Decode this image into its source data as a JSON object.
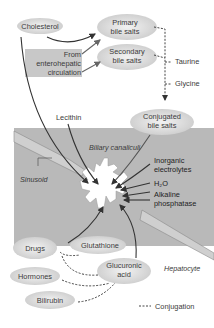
{
  "nodes": {
    "cholesterol": "Cholesterol",
    "primary_bile_salts_1": "Primary",
    "primary_bile_salts_2": "bile salts",
    "secondary_bile_salts_1": "Secondary",
    "secondary_bile_salts_2": "bile salts",
    "enterohepatic_1": "From",
    "enterohepatic_2": "enterohepatic",
    "enterohepatic_3": "circulation",
    "taurine": "Taurine",
    "glycine": "Glycine",
    "conjugated_1": "Conjugated",
    "conjugated_2": "bile salts",
    "lecithin": "Lecithin",
    "biliary_canaliculi": "Biliary canaliculi",
    "sinusoid": "Sinusoid",
    "inorganic_1": "Inorganic",
    "inorganic_2": "electrolytes",
    "h2o": "H₂O",
    "alkaline_1": "Alkaline",
    "alkaline_2": "phosphatase",
    "drugs": "Drugs",
    "glutathione": "Glutathione",
    "glucuronic_1": "Glucuronic",
    "glucuronic_2": "acid",
    "hormones": "Hormones",
    "hepatocyte": "Hepatocyte",
    "bilirubin": "Bilirubin"
  },
  "legend": {
    "conjugation": "Conjugation"
  },
  "colors": {
    "hepatocyte_bg": "#b8b8b8",
    "ellipse_fill": "#d9d9d9",
    "enterohepatic_box": "#c8c8c8",
    "arrow": "#333333",
    "canaliculus": "#ffffff"
  }
}
